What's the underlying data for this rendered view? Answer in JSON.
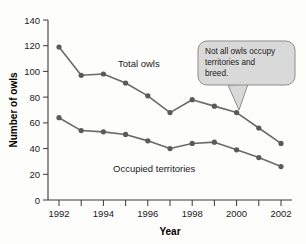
{
  "chart_data": {
    "type": "line",
    "title": "",
    "xlabel": "Year",
    "ylabel": "Number of owls",
    "x": [
      1992,
      1993,
      1994,
      1995,
      1996,
      1997,
      1998,
      1999,
      2000,
      2001,
      2002
    ],
    "xtick_labels": [
      "1992",
      "1994",
      "1996",
      "1998",
      "2000",
      "2002"
    ],
    "xtick_values": [
      1992,
      1994,
      1996,
      1998,
      2000,
      2002
    ],
    "xlim": [
      1991.5,
      2002.5
    ],
    "ytick_labels": [
      "0",
      "20",
      "40",
      "60",
      "80",
      "100",
      "120",
      "140"
    ],
    "ytick_values": [
      0,
      20,
      40,
      60,
      80,
      100,
      120,
      140
    ],
    "ylim": [
      0,
      140
    ],
    "grid": false,
    "legend_position": "inline-labels",
    "series": [
      {
        "name": "Total owls",
        "label": "Total owls",
        "color": "#5a5a5a",
        "values": [
          119,
          97,
          98,
          91,
          81,
          68,
          78,
          73,
          68,
          56,
          44
        ]
      },
      {
        "name": "Occupied territories",
        "label": "Occupied territories",
        "color": "#5a5a5a",
        "values": [
          64,
          54,
          53,
          51,
          46,
          40,
          44,
          45,
          39,
          33,
          26
        ]
      }
    ],
    "annotations": [
      {
        "name": "callout",
        "text_lines": [
          "Not all owls occupy",
          "territories and",
          "breed."
        ],
        "points_to_year": 2000,
        "points_to_value": 68,
        "fill": "#d9d9d9",
        "border": "#8d8d8d"
      }
    ]
  }
}
